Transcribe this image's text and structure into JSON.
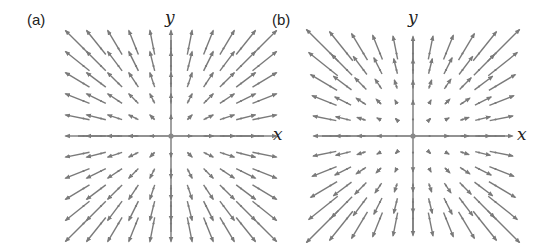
{
  "figure": {
    "panels": [
      {
        "id": "a",
        "label": "(a)",
        "label_pos": [
          27,
          11
        ],
        "x_label": "x",
        "y_label": "y",
        "x_label_pos": [
          273,
          126
        ],
        "y_label_pos": [
          165,
          9
        ],
        "origin": [
          171,
          136
        ],
        "spacing": 17.5,
        "grid_range": [
          -5,
          5
        ],
        "axis_x_extent": [
          78,
          264
        ],
        "axis_y_extent": [
          40,
          232
        ],
        "field": "radial_linear",
        "field_formula": "F(x, y) = (x, y)",
        "arrow_scale": 0.55
      },
      {
        "id": "b",
        "label": "(b)",
        "label_pos": [
          272,
          11
        ],
        "x_label": "x",
        "y_label": "y",
        "x_label_pos": [
          517,
          126
        ],
        "y_label_pos": [
          408,
          9
        ],
        "origin": [
          413,
          136
        ],
        "spacing": 16.5,
        "grid_range": [
          -5,
          5
        ],
        "axis_x_extent": [
          322,
          505
        ],
        "axis_y_extent": [
          40,
          232
        ],
        "field": "radial_quadratic",
        "field_formula": "F(x, y) = r·(x, y)",
        "arrow_scale": 0.11
      }
    ],
    "left_x_label": "x",
    "left_x_label_pos": [
      270,
      126
    ],
    "colors": {
      "arrow": "#7a7a7a",
      "axis": "#6e6e6e",
      "text": "#222222",
      "background": "#ffffff"
    }
  }
}
